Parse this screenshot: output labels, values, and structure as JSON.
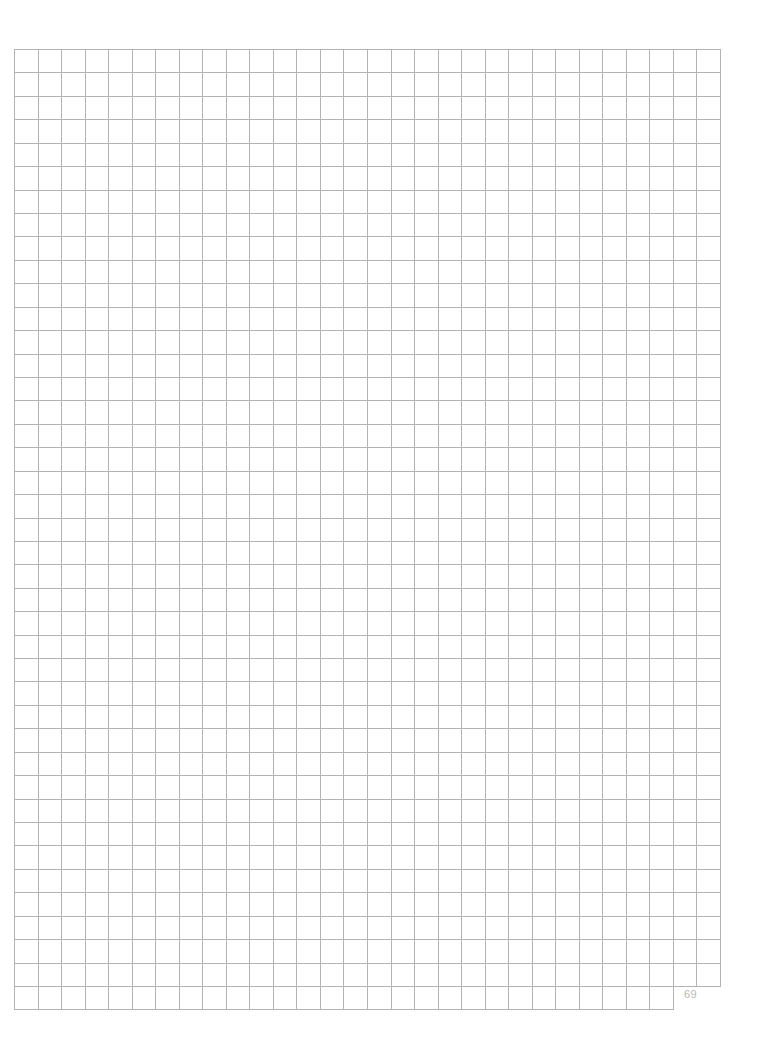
{
  "page": {
    "type": "graph-paper",
    "page_number": "69",
    "background_color": "#ffffff",
    "line_color": "#b3b3b3"
  },
  "grid": {
    "left": 14,
    "top": 49,
    "right": 720,
    "columns": 30,
    "rows": 40,
    "cell_width": 23.53,
    "cell_height": 23.4,
    "last_row": {
      "top": 986,
      "bottom": 1009,
      "columns": 28
    },
    "line_gaps": [
      {
        "y": 529,
        "x_start": 126,
        "x_end": 156
      },
      {
        "y": 506,
        "x_start": 674,
        "x_end": 707
      }
    ]
  }
}
